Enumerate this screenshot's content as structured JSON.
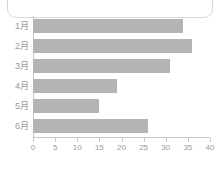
{
  "card": {
    "name": "chart-card"
  },
  "chart_data": {
    "type": "bar",
    "orientation": "horizontal",
    "title": "",
    "subtitle": "",
    "xlabel": "",
    "ylabel": "",
    "categories": [
      "1月",
      "2月",
      "3月",
      "4月",
      "5月",
      "6月"
    ],
    "values": [
      34,
      36,
      31,
      19,
      15,
      26
    ],
    "series": [
      {
        "name": "",
        "values": [
          34,
          36,
          31,
          19,
          15,
          26
        ]
      }
    ],
    "xlim": [
      0,
      40
    ],
    "xticks": [
      0,
      5,
      10,
      15,
      20,
      25,
      30,
      35,
      40
    ],
    "xtick_labels": [
      "0",
      "5",
      "10",
      "15",
      "20",
      "25",
      "30",
      "35",
      "40"
    ],
    "grid": false,
    "legend": false,
    "legend_position": "none",
    "bar_color": "#b4b4b4",
    "axis_color": "#c9c9c9",
    "tick_label_color": "#9a9a9a",
    "category_label_color": "#9a9a9a",
    "background_color": "#ffffff",
    "card_border_color": "#d8d8d8"
  }
}
